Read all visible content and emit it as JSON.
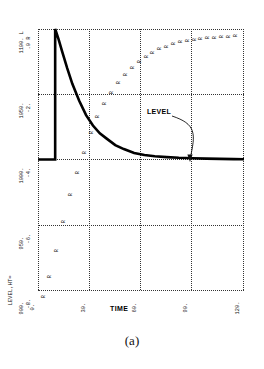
{
  "figure": {
    "caption": "(a)",
    "annotation_label": "LEVEL"
  },
  "chart_data": {
    "type": "line",
    "title": "",
    "subtitle": "",
    "xlabel": "TIME",
    "ylabel": "LEVEL,HT=",
    "xlim": [
      0,
      120
    ],
    "ylim": [
      900,
      1100
    ],
    "grid": true,
    "legend_position": "none",
    "x_ticks": [
      "0.",
      "30.",
      "60.",
      "90.",
      "120."
    ],
    "x_tick_values": [
      0,
      30,
      60,
      90,
      120
    ],
    "y_ticks": [
      "1100.",
      "1050.",
      "1000.",
      "950.",
      "900."
    ],
    "y_tick_values": [
      1100,
      1050,
      1000,
      950,
      900
    ],
    "y_ticks_secondary": [
      "0.",
      "-2.",
      "-4.",
      "-6.",
      "-8."
    ],
    "y_secondary_values": [
      0,
      -2,
      -4,
      -6,
      -8
    ],
    "axis_header_left": "1100. L",
    "axis_header_right": ".0 R",
    "series": [
      {
        "name": "L",
        "marker": "L",
        "style": "thick-solid",
        "x": [
          0,
          2,
          4,
          6,
          8,
          10,
          10,
          12,
          14,
          17,
          20,
          24,
          28,
          32,
          36,
          40,
          45,
          50,
          56,
          62,
          68,
          75,
          82,
          90,
          98,
          106,
          114,
          120
        ],
        "values": [
          1000,
          1000,
          1000,
          1000,
          1000,
          1000,
          1100,
          1092,
          1083,
          1070,
          1058,
          1045,
          1034,
          1026,
          1020,
          1016,
          1011,
          1008,
          1005,
          1003.5,
          1002.5,
          1001.8,
          1001.3,
          1001,
          1000.7,
          1000.5,
          1000.3,
          1000.2
        ]
      },
      {
        "name": "R",
        "marker": "R",
        "style": "character-plot",
        "x": [
          6,
          10,
          14,
          18,
          22,
          26,
          30,
          34,
          38,
          42,
          46,
          50,
          54,
          58,
          62,
          66,
          70,
          74,
          78,
          82,
          86,
          90,
          94,
          98,
          102,
          106,
          110,
          114,
          118
        ],
        "values": [
          -8.0,
          -7.4,
          -6.6,
          -5.7,
          -4.9,
          -4.2,
          -3.6,
          -3.0,
          -2.5,
          -2.1,
          -1.75,
          -1.45,
          -1.2,
          -0.98,
          -0.8,
          -0.65,
          -0.52,
          -0.42,
          -0.34,
          -0.27,
          -0.21,
          -0.17,
          -0.13,
          -0.1,
          -0.08,
          -0.06,
          -0.04,
          -0.03,
          -0.02
        ]
      }
    ],
    "annotations": [
      {
        "text": "LEVEL",
        "points_to_series": "L",
        "arrow": "curved"
      }
    ]
  }
}
